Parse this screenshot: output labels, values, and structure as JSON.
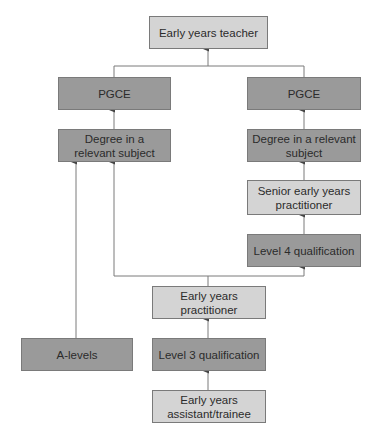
{
  "nodes": {
    "teacher": {
      "label": "Early years teacher",
      "shade": "light"
    },
    "pgce_left": {
      "label": "PGCE",
      "shade": "dark"
    },
    "pgce_right": {
      "label": "PGCE",
      "shade": "dark"
    },
    "degree_left": {
      "label": "Degree in a relevant subject",
      "shade": "dark"
    },
    "degree_right": {
      "label": "Degree in a relevant subject",
      "shade": "dark"
    },
    "senior": {
      "label": "Senior early years practitioner",
      "shade": "light"
    },
    "level4": {
      "label": "Level 4 qualification",
      "shade": "dark"
    },
    "practitioner": {
      "label": "Early years practitioner",
      "shade": "light"
    },
    "alevels": {
      "label": "A-levels",
      "shade": "dark"
    },
    "level3": {
      "label": "Level 3 qualification",
      "shade": "dark"
    },
    "assistant": {
      "label": "Early years assistant/trainee",
      "shade": "light"
    }
  },
  "edges": [
    {
      "from": "pgce_left",
      "to": "teacher"
    },
    {
      "from": "pgce_right",
      "to": "teacher"
    },
    {
      "from": "degree_left",
      "to": "pgce_left"
    },
    {
      "from": "degree_right",
      "to": "pgce_right"
    },
    {
      "from": "senior",
      "to": "degree_right"
    },
    {
      "from": "level4",
      "to": "senior"
    },
    {
      "from": "practitioner",
      "to": "degree_left"
    },
    {
      "from": "practitioner",
      "to": "level4"
    },
    {
      "from": "alevels",
      "to": "degree_left"
    },
    {
      "from": "level3",
      "to": "practitioner"
    },
    {
      "from": "assistant",
      "to": "level3"
    }
  ],
  "colors": {
    "light": "#d4d4d4",
    "dark": "#9a9a9a",
    "line": "#7a7a7a"
  }
}
